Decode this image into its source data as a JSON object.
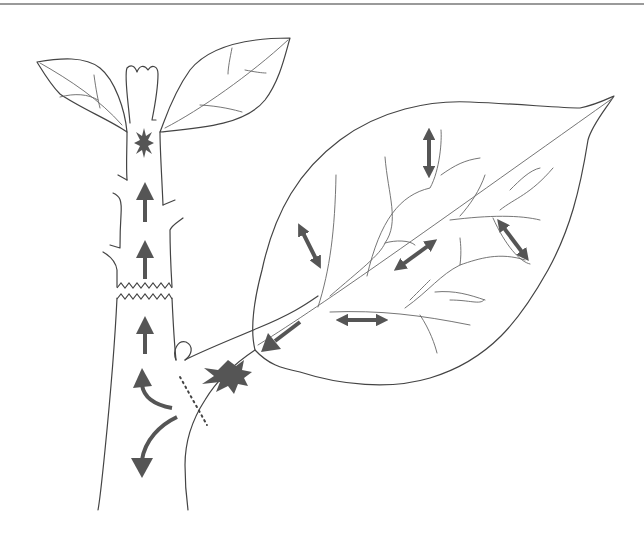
{
  "diagram": {
    "title": "",
    "colors": {
      "background": "#ffffff",
      "outline": "#444444",
      "vein": "#666666",
      "arrow": "#555555",
      "top_rule": "#9a9a9a"
    },
    "labels": []
  },
  "elements": {
    "stem": {
      "name": "main stem"
    },
    "apical_bud": {
      "name": "apical bud"
    },
    "upper_left_leaf": {
      "name": "upper left leaf"
    },
    "upper_right_leaf": {
      "name": "upper right leaf"
    },
    "large_leaf": {
      "name": "large lateral leaf"
    },
    "axillary_bud": {
      "name": "axillary bud"
    },
    "girdle_cut": {
      "name": "zigzag girdle on stem"
    },
    "abscission_line": {
      "name": "dotted abscission line at petiole base"
    },
    "stem_burst": {
      "name": "burst in upper stem"
    },
    "petiole_burst": {
      "name": "burst in petiole"
    },
    "stem_arrows": [
      {
        "direction": "up",
        "x": 145,
        "y1": 222,
        "y2": 184
      },
      {
        "direction": "up",
        "x": 145,
        "y1": 279,
        "y2": 240
      },
      {
        "direction": "up",
        "x": 145,
        "y1": 354,
        "y2": 316
      }
    ],
    "curved_arrows": [
      {
        "direction": "up-left",
        "note": "curving up into stem"
      },
      {
        "direction": "down",
        "note": "curving down stem"
      }
    ],
    "leaf_double_arrows": [
      {
        "x1": 429,
        "y1": 128,
        "x2": 429,
        "y2": 178
      },
      {
        "x1": 299,
        "y1": 224,
        "x2": 320,
        "y2": 268
      },
      {
        "x1": 395,
        "y1": 270,
        "x2": 436,
        "y2": 240
      },
      {
        "x1": 498,
        "y1": 220,
        "x2": 528,
        "y2": 260
      },
      {
        "x1": 337,
        "y1": 320,
        "x2": 387,
        "y2": 320
      }
    ],
    "petiole_arrow": {
      "direction": "down-left",
      "x1": 300,
      "y1": 322,
      "x2": 262,
      "y2": 350
    }
  }
}
